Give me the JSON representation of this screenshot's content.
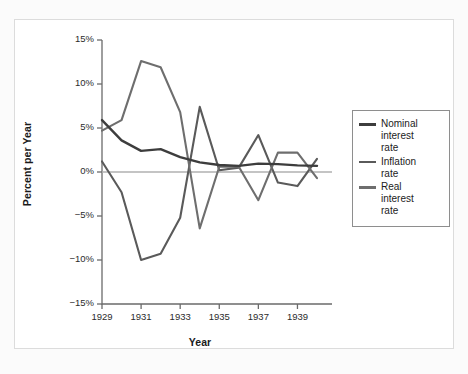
{
  "chart_data": {
    "type": "line",
    "title": "",
    "xlabel": "Year",
    "ylabel": "Percent per Year",
    "x": [
      1929,
      1930,
      1931,
      1932,
      1933,
      1934,
      1935,
      1936,
      1937,
      1938,
      1939,
      1940
    ],
    "xlim": [
      1929,
      1940
    ],
    "ylim": [
      -15,
      15
    ],
    "ytick_labels": [
      "15%",
      "10%",
      "5%",
      "0%",
      "-5%",
      "-10%",
      "-15%"
    ],
    "ytick_values": [
      15,
      10,
      5,
      0,
      -5,
      -10,
      -15
    ],
    "xtick_labels": [
      "1929",
      "1931",
      "1933",
      "1935",
      "1937",
      "1939"
    ],
    "xtick_values": [
      1929,
      1931,
      1933,
      1935,
      1937,
      1939
    ],
    "grid": false,
    "legend_position": "right-outside",
    "zero_line": true,
    "series": [
      {
        "name": "Nominal interest rate",
        "legend_label": "Nominal\ninterest\nrate",
        "color": "#3d3d3d",
        "width": 2.4,
        "values": [
          5.9,
          3.6,
          2.4,
          2.6,
          1.7,
          1.0,
          0.75,
          0.75,
          0.94,
          0.81,
          0.59,
          0.56
        ]
      },
      {
        "name": "Inflation rate",
        "legend_label": "Inflation\nrate",
        "color": "#5a5a5a",
        "width": 2.1,
        "values": [
          1.2,
          -2.3,
          -9.0,
          -9.9,
          -5.1,
          3.4,
          2.6,
          1.0,
          3.7,
          -2.0,
          -1.3,
          0.7
        ]
      },
      {
        "name": "Real interest rate",
        "legend_label": "Real\ninterest\nrate",
        "color": "#6e6e6e",
        "width": 2.1,
        "values": [
          4.7,
          5.9,
          11.4,
          12.5,
          6.8,
          -2.4,
          -1.85,
          -0.25,
          -2.76,
          2.81,
          1.89,
          -0.14
        ]
      }
    ],
    "series_plotted": [
      {
        "name": "Inflation rate",
        "points": [
          [
            1929,
            1.2
          ],
          [
            1930,
            -2.3
          ],
          [
            1931,
            -10.0
          ],
          [
            1932,
            -9.3
          ],
          [
            1933,
            -5.2
          ],
          [
            1934,
            7.4
          ],
          [
            1935,
            0.2
          ],
          [
            1936,
            0.5
          ],
          [
            1937,
            4.2
          ],
          [
            1938,
            -1.2
          ],
          [
            1939,
            -1.6
          ],
          [
            1940,
            1.5
          ]
        ]
      },
      {
        "name": "Real interest rate",
        "points": [
          [
            1929,
            4.7
          ],
          [
            1930,
            5.9
          ],
          [
            1931,
            12.6
          ],
          [
            1932,
            11.9
          ],
          [
            1933,
            6.8
          ],
          [
            1934,
            -6.4
          ],
          [
            1935,
            0.6
          ],
          [
            1936,
            0.6
          ],
          [
            1937,
            -3.2
          ],
          [
            1938,
            2.2
          ],
          [
            1939,
            2.2
          ],
          [
            1940,
            -0.7
          ]
        ]
      },
      {
        "name": "Nominal interest rate",
        "points": [
          [
            1929,
            5.9
          ],
          [
            1930,
            3.6
          ],
          [
            1931,
            2.4
          ],
          [
            1932,
            2.6
          ],
          [
            1933,
            1.7
          ],
          [
            1934,
            1.1
          ],
          [
            1935,
            0.8
          ],
          [
            1936,
            0.7
          ],
          [
            1937,
            0.95
          ],
          [
            1938,
            0.9
          ],
          [
            1939,
            0.75
          ],
          [
            1940,
            0.7
          ]
        ]
      }
    ]
  },
  "legend": {
    "items": [
      {
        "label": "Nominal\ninterest\nrate",
        "color": "#3d3d3d"
      },
      {
        "label": "Inflation\nrate",
        "color": "#5a5a5a"
      },
      {
        "label": "Real\ninterest\nrate",
        "color": "#6e6e6e"
      }
    ]
  },
  "axes": {
    "x_title": "Year",
    "y_title": "Percent per Year"
  },
  "colors": {
    "axis": "#6b6b6b",
    "zero_line": "#b0b0b0",
    "text": "#1b1b1b",
    "frame": "#dcdcdc",
    "page_bg": "#fbfbfb",
    "plot_bg": "#ffffff"
  }
}
